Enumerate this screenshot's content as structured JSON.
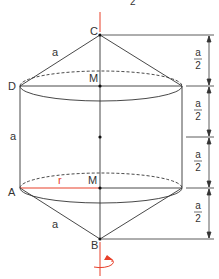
{
  "header": {
    "partial_text": "2"
  },
  "points": {
    "C": "C",
    "D": "D",
    "M_top": "M",
    "M_bottom": "M",
    "A": "A",
    "B": "B"
  },
  "edges": {
    "cone_top_slant": "a",
    "cylinder_height": "a",
    "cone_bottom_slant": "a",
    "radius": "r"
  },
  "dimensions": [
    {
      "num": "a",
      "den": "2"
    },
    {
      "num": "a",
      "den": "2"
    },
    {
      "num": "a",
      "den": "2"
    },
    {
      "num": "a",
      "den": "2"
    }
  ],
  "colors": {
    "line": "#333333",
    "accent": "#e8402a"
  }
}
